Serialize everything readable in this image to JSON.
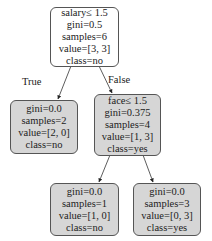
{
  "tree": {
    "nodes": [
      {
        "id": "root",
        "lines": [
          "salary≤ 1.5",
          "gini=0.5",
          "samples=6",
          "value=[3, 3]",
          "class=no"
        ],
        "fill": "#ffffff"
      },
      {
        "id": "left",
        "lines": [
          "gini=0.0",
          "samples=2",
          "value=[2, 0]",
          "class=no"
        ],
        "fill": "#d6d6d6"
      },
      {
        "id": "right",
        "lines": [
          "face≤ 1.5",
          "gini=0.375",
          "samples=4",
          "value=[1, 3]",
          "class=yes"
        ],
        "fill": "#d6d6d6"
      },
      {
        "id": "right-left",
        "lines": [
          "gini=0.0",
          "samples=1",
          "value=[1, 0]",
          "class=no"
        ],
        "fill": "#d6d6d6"
      },
      {
        "id": "right-right",
        "lines": [
          "gini=0.0",
          "samples=3",
          "value=[0, 3]",
          "class=yes"
        ],
        "fill": "#d6d6d6"
      }
    ],
    "edge_labels": {
      "true": "True",
      "false": "False"
    }
  }
}
